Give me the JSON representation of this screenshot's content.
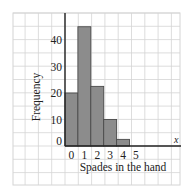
{
  "chart_data": {
    "type": "bar",
    "title": "",
    "xlabel": "Spades in the hand",
    "ylabel": "Frequency",
    "axis_end_label": "x",
    "categories": [
      "0",
      "1",
      "2",
      "3",
      "4",
      "5"
    ],
    "values": [
      20,
      45,
      22.5,
      10,
      2.5,
      0
    ],
    "yticks": [
      "0",
      "10",
      "20",
      "30",
      "40"
    ],
    "ylim": [
      0,
      50
    ],
    "grid": true,
    "bar_fill": "#8c8c8c",
    "bar_edge": "#4a4a4a",
    "grid_color": "#d4d4d4",
    "axis_color": "#222222"
  }
}
